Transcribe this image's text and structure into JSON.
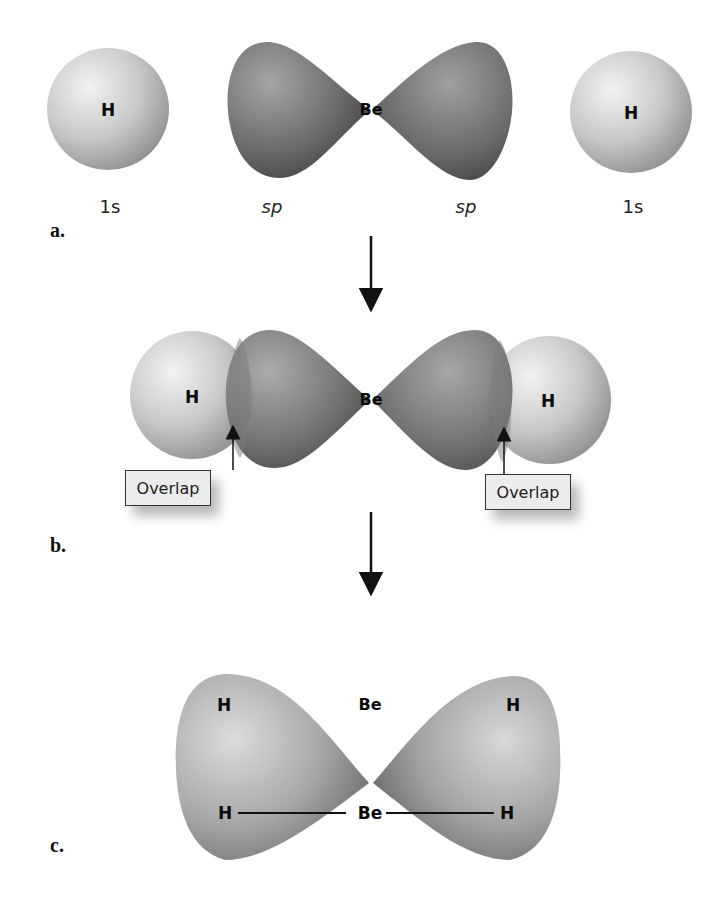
{
  "figure": {
    "panels": [
      {
        "id": "a",
        "label": "a.",
        "orbitals": [
          {
            "atom": "H",
            "orbital": "1s"
          },
          {
            "atom": "Be",
            "orbital": "sp"
          },
          {
            "atom": "Be",
            "orbital": "sp"
          },
          {
            "atom": "H",
            "orbital": "1s"
          }
        ],
        "center_atom": "Be",
        "left_atom": "H",
        "right_atom": "H",
        "labels": {
          "left_1s": "1s",
          "left_sp": "sp",
          "right_sp": "sp",
          "right_1s": "1s"
        }
      },
      {
        "id": "b",
        "label": "b.",
        "left_atom": "H",
        "center_atom": "Be",
        "right_atom": "H",
        "callouts": {
          "left": "Overlap",
          "right": "Overlap"
        }
      },
      {
        "id": "c",
        "label": "c.",
        "left_atom": "H",
        "center_atom": "Be",
        "right_atom": "H",
        "structural_formula": {
          "left": "H",
          "center": "Be",
          "right": "H"
        }
      }
    ],
    "colors": {
      "s_orbital_light": "#e6e6e6",
      "s_orbital_dark": "#9a9a9a",
      "sp_orbital_light": "#9c9c9c",
      "sp_orbital_dark": "#3c3c3c",
      "background": "#ffffff"
    }
  }
}
